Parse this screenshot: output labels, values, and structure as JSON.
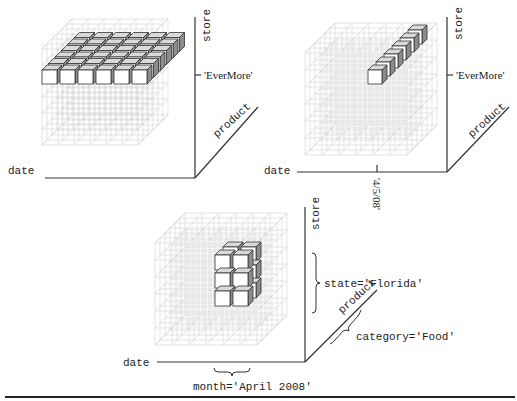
{
  "figure": {
    "panels": [
      {
        "id": "slice",
        "origin": [
          45,
          180
        ],
        "axes": {
          "x_label": "date",
          "y_label": "store",
          "z_label": "product"
        },
        "annotations": [
          {
            "axis": "store",
            "label": "'EverMore'",
            "type": "tick"
          }
        ],
        "highlight": "horizontal slice: all dates × all products at store 'EverMore'"
      },
      {
        "id": "dice-line",
        "origin": [
          310,
          180
        ],
        "axes": {
          "x_label": "date",
          "y_label": "store",
          "z_label": "product"
        },
        "annotations": [
          {
            "axis": "store",
            "label": "'EverMore'",
            "type": "tick"
          },
          {
            "axis": "date",
            "label": "'4/5/08'",
            "type": "tick"
          }
        ],
        "highlight": "row of cells along product axis at date '4/5/08' and store 'EverMore'"
      },
      {
        "id": "subcube",
        "origin": [
          175,
          364
        ],
        "axes": {
          "x_label": "date",
          "y_label": "store",
          "z_label": "product"
        },
        "annotations": [
          {
            "axis": "store",
            "label": "state='Florida'",
            "type": "brace"
          },
          {
            "axis": "product",
            "label": "category='Food'",
            "type": "brace"
          },
          {
            "axis": "date",
            "label": "month='April 2008'",
            "type": "brace"
          }
        ],
        "highlight": "2×3×3 sub-cube"
      }
    ],
    "colors": {
      "axis": "#333333",
      "grid": "#c8c8c8",
      "cube_front": "#ffffff",
      "cube_top": "#d9d9d9",
      "cube_side": "#8c8c8c"
    }
  }
}
